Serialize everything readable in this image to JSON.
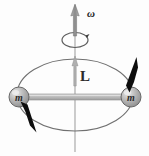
{
  "figure": {
    "kind": "physics-diagram",
    "canvas": {
      "width": 149,
      "height": 156,
      "background": "#fdfdfd"
    },
    "labels": {
      "omega": "ω",
      "angular_momentum": "L",
      "mass_left": "m",
      "mass_right": "m"
    },
    "colors": {
      "axis_line": "#9a9a9a",
      "orbit_ellipse": "#6f6f6f",
      "rod": "#b8b8b8",
      "rod_edge": "#8c8c8c",
      "sphere_fill": "#a9a9a9",
      "sphere_edge": "#6b6b6b",
      "sphere_highlight": "#e2e2e2",
      "velocity_arrow": "#111111",
      "omega_arrow": "#8e8e8e",
      "L_arrow": "#a5a5a5",
      "spin_circle": "#6a6a6a",
      "text": "#1f1f1f"
    },
    "elements": {
      "vertical_axis": {
        "x": 75,
        "y_top": 6,
        "y_bottom": 152
      },
      "orbit_ellipse": {
        "cx": 75,
        "cy": 95,
        "rx": 58,
        "ry": 36
      },
      "rod": {
        "x1": 19,
        "x2": 131,
        "y": 97,
        "thickness": 6
      },
      "mass_left": {
        "cx": 19,
        "cy": 97,
        "r": 10
      },
      "mass_right": {
        "cx": 131,
        "cy": 97,
        "r": 10
      },
      "omega_arrow": {
        "x": 75,
        "y_tail": 34,
        "y_head": 6
      },
      "L_arrow": {
        "x": 75,
        "y_tail": 82,
        "y_head": 58
      },
      "spin_circle": {
        "cx": 75,
        "cy": 40,
        "rx": 13,
        "ry": 7
      },
      "velocity_left": {
        "x1": 22,
        "y1": 103,
        "x2": 36,
        "y2": 133
      },
      "velocity_right": {
        "x1": 128,
        "y1": 92,
        "x2": 140,
        "y2": 59
      }
    }
  }
}
